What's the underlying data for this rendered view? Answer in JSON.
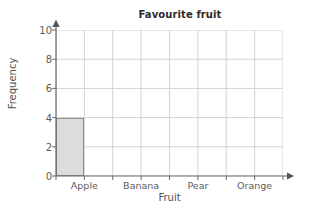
{
  "chart_data": {
    "type": "bar",
    "title": "Favourite fruit",
    "xlabel": "Fruit",
    "ylabel": "Frequency",
    "categories": [
      "Apple",
      "Banana",
      "Pear",
      "Orange"
    ],
    "values": [
      4,
      0,
      0,
      0
    ],
    "ylim": [
      0,
      10
    ],
    "yticks": [
      0,
      2,
      4,
      6,
      8,
      10
    ],
    "ytick_labels": [
      "0",
      "2",
      "4",
      "6",
      "8",
      "10"
    ],
    "grid": true,
    "grid_columns": 8,
    "legend": "none",
    "bar_fill_color": "#dcdcdc",
    "bar_border_color": "#8c8c8c",
    "grid_line_color": "#d3d3d3",
    "axis_color": "#6b6b6b",
    "title_color": "#2b2b2b",
    "axis_arrow_x": true,
    "axis_arrow_y": true
  }
}
